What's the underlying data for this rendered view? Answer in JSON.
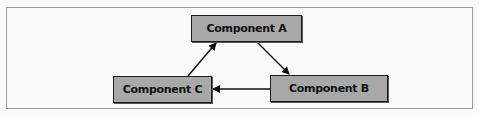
{
  "diagram": {
    "type": "cycle",
    "nodes": [
      {
        "id": "a",
        "label": "Component A"
      },
      {
        "id": "b",
        "label": "Component B"
      },
      {
        "id": "c",
        "label": "Component C"
      }
    ],
    "edges": [
      {
        "from": "c",
        "to": "a"
      },
      {
        "from": "a",
        "to": "b"
      },
      {
        "from": "b",
        "to": "c"
      }
    ],
    "colors": {
      "node_fill": "#a8a8a8",
      "node_border": "#1c1c1c",
      "edge": "#111111",
      "frame_border": "#9a9a9a"
    }
  }
}
